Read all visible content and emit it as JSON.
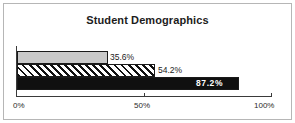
{
  "chart_data": {
    "type": "bar",
    "orientation": "horizontal",
    "title": "Student Demographics",
    "xlabel": "",
    "ylabel": "",
    "categories": [
      "",
      "",
      ""
    ],
    "values": [
      35.6,
      54.2,
      87.2
    ],
    "data_labels": [
      "35.6%",
      "54.2%",
      "87.2%"
    ],
    "xlim": [
      0,
      100
    ],
    "xticks": [
      0,
      50,
      100
    ],
    "xtick_labels": [
      "0%",
      "50%",
      "100%"
    ],
    "grid": false,
    "legend": "none",
    "series": [
      {
        "name": "bar-1",
        "value": 35.6,
        "label": "35.6%",
        "fill": "solid-light-gray",
        "color": "#c9c9c9"
      },
      {
        "name": "bar-2",
        "value": 54.2,
        "label": "54.2%",
        "fill": "diagonal-hatch",
        "color": "#111111"
      },
      {
        "name": "bar-3",
        "value": 87.2,
        "label": "87.2%",
        "fill": "solid-black",
        "color": "#101010"
      }
    ]
  },
  "axis": {
    "tick_0": "0%",
    "tick_50": "50%",
    "tick_100": "100%"
  },
  "colors": {
    "frame_border": "#b6b6b6",
    "axis_line": "#3a3a3a",
    "text": "#1c1c1c",
    "label_on_dark": "#ffffff",
    "background": "#ffffff"
  }
}
